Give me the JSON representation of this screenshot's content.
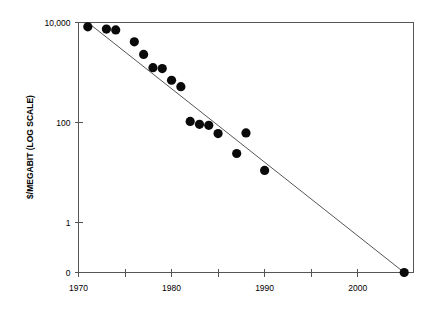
{
  "chart_data": {
    "type": "scatter",
    "title": "",
    "xlabel": "",
    "ylabel": "$/MEGABIT (LOG SCALE)",
    "grid": false,
    "legend": null,
    "xlim": [
      1970,
      2006
    ],
    "ylim_log_labels": [
      "0",
      "1",
      "100",
      "10,000"
    ],
    "x_ticks_major": [
      1970,
      1980,
      1990,
      2000
    ],
    "x_ticks_major_labels": [
      "1970",
      "1980",
      "1990",
      "2000"
    ],
    "x_ticks_minor": [
      1975,
      1985,
      1995,
      2005
    ],
    "y_ticks": [
      {
        "label": "10,000",
        "value": 10000
      },
      {
        "label": "100",
        "value": 100
      },
      {
        "label": "1",
        "value": 1
      },
      {
        "label": "0",
        "value": 0
      }
    ],
    "series": [
      {
        "name": "Memory price",
        "marker": "filled-circle",
        "color": "#0a0a0a",
        "points": [
          {
            "x": 1971,
            "y": 8200
          },
          {
            "x": 1973,
            "y": 7400
          },
          {
            "x": 1974,
            "y": 7100
          },
          {
            "x": 1976,
            "y": 4100
          },
          {
            "x": 1977,
            "y": 2300
          },
          {
            "x": 1978,
            "y": 1250
          },
          {
            "x": 1979,
            "y": 1200
          },
          {
            "x": 1980,
            "y": 700
          },
          {
            "x": 1981,
            "y": 520
          },
          {
            "x": 1982,
            "y": 105
          },
          {
            "x": 1983,
            "y": 92
          },
          {
            "x": 1984,
            "y": 88
          },
          {
            "x": 1985,
            "y": 60
          },
          {
            "x": 1987,
            "y": 24
          },
          {
            "x": 1988,
            "y": 62
          },
          {
            "x": 1990,
            "y": 11
          },
          {
            "x": 2005,
            "y": 0
          }
        ]
      }
    ],
    "trend_line": {
      "name": "log-linear trend",
      "color": "#555555",
      "from": {
        "x": 1971,
        "y": 10000
      },
      "to": {
        "x": 2005,
        "y": 0
      }
    }
  }
}
